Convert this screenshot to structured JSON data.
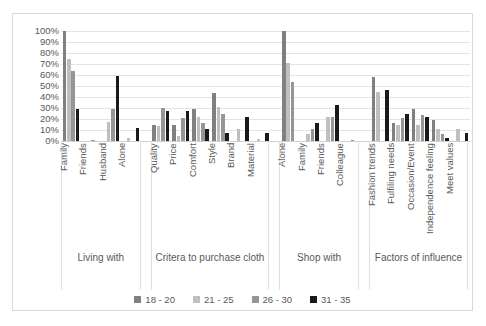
{
  "chart_data": {
    "type": "bar",
    "title": "",
    "subtitle": "",
    "xlabel": "",
    "ylabel": "",
    "ylim": [
      0,
      100
    ],
    "grid": true,
    "legend_position": "bottom",
    "y_ticks": [
      "100%",
      "90%",
      "80%",
      "70%",
      "60%",
      "50%",
      "40%",
      "30%",
      "20%",
      "10%",
      "0%"
    ],
    "series": [
      {
        "name": "18 - 20",
        "color": "#808080"
      },
      {
        "name": "21 - 25",
        "color": "#bfbfbf"
      },
      {
        "name": "26 - 30",
        "color": "#969696"
      },
      {
        "name": "31 - 35",
        "color": "#1a1a1a"
      }
    ],
    "groups": [
      {
        "name": "Living with",
        "categories": [
          "Family",
          "Friends",
          "Husband",
          "Alone"
        ],
        "values": [
          [
            100,
            75,
            64,
            29
          ],
          [
            0,
            0,
            1,
            0
          ],
          [
            0,
            17,
            29,
            59
          ],
          [
            0,
            3,
            0,
            12
          ]
        ]
      },
      {
        "name": "Critera to purchase cloth",
        "categories": [
          "Quality",
          "Price",
          "Comfort",
          "Style",
          "Brand",
          "Material"
        ],
        "values": [
          [
            15,
            14,
            30,
            27
          ],
          [
            15,
            5,
            21,
            27
          ],
          [
            29,
            22,
            16,
            11
          ],
          [
            44,
            31,
            25,
            7
          ],
          [
            0,
            11,
            0,
            22
          ],
          [
            0,
            2,
            0,
            7
          ]
        ]
      },
      {
        "name": "Shop with",
        "categories": [
          "Alone",
          "Family",
          "Friends",
          "Colleague"
        ],
        "values": [
          [
            100,
            71,
            54,
            0
          ],
          [
            0,
            6,
            11,
            16
          ],
          [
            0,
            22,
            22,
            33
          ],
          [
            0,
            0,
            1,
            0
          ]
        ]
      },
      {
        "name": "Factors of influence",
        "categories": [
          "Fashion trends",
          "Fulfiling needs",
          "Occasion/Event",
          "Independence feeling",
          "Meet values"
        ],
        "values": [
          [
            58,
            45,
            0,
            46
          ],
          [
            16,
            15,
            21,
            25
          ],
          [
            29,
            15,
            24,
            22
          ],
          [
            19,
            11,
            6,
            3
          ],
          [
            0,
            11,
            0,
            7
          ]
        ]
      }
    ]
  },
  "legend": {
    "items": [
      {
        "label": "18 - 20",
        "color": "#808080"
      },
      {
        "label": "21 - 25",
        "color": "#bfbfbf"
      },
      {
        "label": "26 - 30",
        "color": "#969696"
      },
      {
        "label": "31 - 35",
        "color": "#1a1a1a"
      }
    ]
  }
}
